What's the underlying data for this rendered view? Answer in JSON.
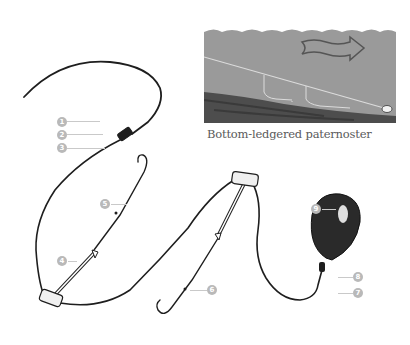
{
  "figure": {
    "caption": "Bottom-ledgered paternoster",
    "inset_description": "Cross-section of water over riverbed showing paternoster rig with two hooks and lead, current arrow pointing right",
    "colors": {
      "water": "#9a9a9a",
      "riverbed": "#4a4a4a",
      "line": "#1e1e1e",
      "badge": "#b9b9b9",
      "leader": "#c9c9c9"
    }
  },
  "labels": [
    {
      "id": "1",
      "text": "1"
    },
    {
      "id": "2",
      "text": "2"
    },
    {
      "id": "3",
      "text": "3"
    },
    {
      "id": "4",
      "text": "4"
    },
    {
      "id": "5",
      "text": "5"
    },
    {
      "id": "6",
      "text": "6"
    },
    {
      "id": "7",
      "text": "7"
    },
    {
      "id": "8",
      "text": "8"
    },
    {
      "id": "9",
      "text": "9"
    }
  ]
}
